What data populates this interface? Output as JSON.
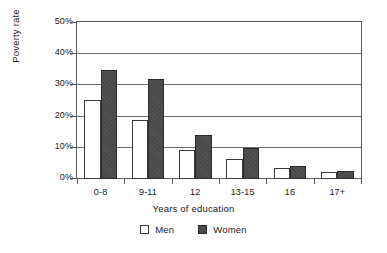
{
  "chart_data": {
    "type": "bar",
    "title": "",
    "xlabel": "Years of education",
    "ylabel": "Poverty rate",
    "categories": [
      "0-8",
      "9-11",
      "12",
      "13-15",
      "16",
      "17+"
    ],
    "series": [
      {
        "name": "Men",
        "color": "#ffffff",
        "values": [
          25.2,
          19.0,
          9.4,
          6.5,
          3.5,
          2.4
        ]
      },
      {
        "name": "Women",
        "color": "#494949",
        "values": [
          35.1,
          32.1,
          14.0,
          9.8,
          4.2,
          2.6
        ]
      }
    ],
    "ylim": [
      0,
      50
    ],
    "yticks": [
      0,
      10,
      20,
      30,
      40,
      50
    ],
    "ytick_labels": [
      "0%",
      "10%",
      "20%",
      "30%",
      "40%",
      "50%"
    ],
    "grid": true,
    "legend_position": "bottom-center"
  },
  "legend": {
    "men_label": "Men",
    "women_label": "Women"
  }
}
